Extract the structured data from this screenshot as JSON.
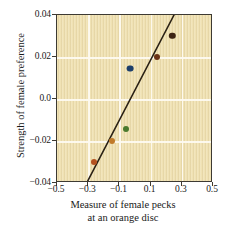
{
  "chart_data": {
    "type": "scatter",
    "title": "",
    "xlabel": "Measure of female pecks at an orange disc",
    "xlabel_line1": "Measure of female pecks",
    "xlabel_line2": "at an orange disc",
    "ylabel": "Strength of female preference",
    "xlim": [
      -0.5,
      0.5
    ],
    "ylim": [
      -0.04,
      0.04
    ],
    "xticks": [
      -0.5,
      -0.3,
      -0.1,
      0.1,
      0.3,
      0.5
    ],
    "xticklabels": [
      "−0.5",
      "−0.3",
      "−0.1",
      "0.1",
      "0.3",
      "0.5"
    ],
    "yticks": [
      -0.04,
      -0.02,
      0.0,
      0.02,
      0.04
    ],
    "yticklabels": [
      "−0.04",
      "−0.02",
      "0.0",
      "0.02",
      "0.04"
    ],
    "grid": true,
    "legend": "none",
    "points": [
      {
        "x": -0.26,
        "y": -0.03,
        "color": "#b4521f",
        "r": 3.0
      },
      {
        "x": -0.15,
        "y": -0.02,
        "color": "#c07a2a",
        "r": 3.0
      },
      {
        "x": -0.06,
        "y": -0.0145,
        "color": "#4a7a2e",
        "r": 3.0
      },
      {
        "x": -0.03,
        "y": 0.0145,
        "color": "#1d3f6b",
        "r": 3.4
      },
      {
        "x": 0.14,
        "y": 0.02,
        "color": "#6b3315",
        "r": 3.0
      },
      {
        "x": 0.24,
        "y": 0.03,
        "color": "#3d2414",
        "r": 3.2
      }
    ],
    "trendline": {
      "x1": -0.3,
      "y1": -0.04,
      "x2": 0.26,
      "y2": 0.04,
      "color": "#2a2114",
      "width": 1.6
    },
    "plot_background_color": "#f0e2b4",
    "grid_color": "#fdfaf0",
    "frame_color": "#3d3a33"
  }
}
